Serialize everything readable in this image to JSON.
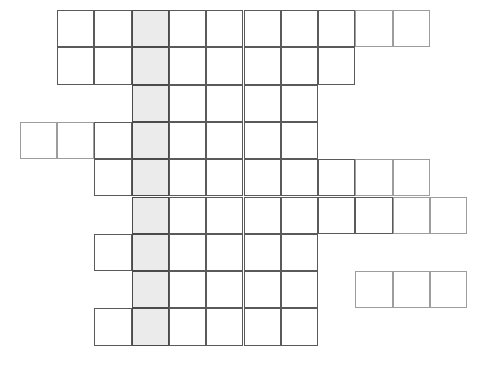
{
  "puzzle": {
    "kind": "crossword-grid",
    "title": "Crossword Puzzle Grid",
    "description": "Blank interlocking crossword grid of nine horizontal word rows with one vertically shaded highlight column.",
    "canvas": {
      "width": 487,
      "height": 373,
      "background": "#ffffff"
    },
    "geometry": {
      "cell_size": 37.3,
      "origin_x": 57,
      "origin_y": 10,
      "rows": 9,
      "column_index_min": -1,
      "column_index_max": 10
    },
    "colors": {
      "cell_fill": "#ffffff",
      "cell_stroke": "#5a5a5a",
      "cell_stroke_soft": "#9d9d9d",
      "shaded_fill": "#ebebeb",
      "shaded_stroke": "#4a4a4a"
    },
    "highlight": {
      "name": "key-answer-column",
      "column_index": 2,
      "from_row": 1,
      "to_row": 9,
      "cell_count": 9,
      "fill": "#ebebeb"
    },
    "totals": {
      "row_count": 9,
      "cell_count": 64,
      "shaded_cell_count": 9
    },
    "rows": [
      {
        "number": 1,
        "label": "row-1",
        "segments": [
          {
            "start": 0,
            "end": 9
          }
        ],
        "length": 10,
        "letters": [
          "",
          "",
          "",
          "",
          "",
          "",
          "",
          "",
          "",
          ""
        ]
      },
      {
        "number": 2,
        "label": "row-2",
        "segments": [
          {
            "start": 0,
            "end": 7
          }
        ],
        "length": 8,
        "letters": [
          "",
          "",
          "",
          "",
          "",
          "",
          "",
          ""
        ]
      },
      {
        "number": 3,
        "label": "row-3",
        "segments": [
          {
            "start": 2,
            "end": 6
          }
        ],
        "length": 5,
        "letters": [
          "",
          "",
          "",
          "",
          ""
        ]
      },
      {
        "number": 4,
        "label": "row-4",
        "segments": [
          {
            "start": -1,
            "end": 6
          }
        ],
        "length": 8,
        "letters": [
          "",
          "",
          "",
          "",
          "",
          "",
          "",
          ""
        ]
      },
      {
        "number": 5,
        "label": "row-5",
        "segments": [
          {
            "start": 1,
            "end": 9
          }
        ],
        "length": 9,
        "letters": [
          "",
          "",
          "",
          "",
          "",
          "",
          "",
          "",
          ""
        ]
      },
      {
        "number": 6,
        "label": "row-6",
        "segments": [
          {
            "start": 2,
            "end": 10
          }
        ],
        "length": 9,
        "letters": [
          "",
          "",
          "",
          "",
          "",
          "",
          "",
          "",
          ""
        ]
      },
      {
        "number": 7,
        "label": "row-7",
        "segments": [
          {
            "start": 1,
            "end": 6
          }
        ],
        "length": 6,
        "letters": [
          "",
          "",
          "",
          "",
          "",
          ""
        ]
      },
      {
        "number": 8,
        "label": "row-8",
        "segments": [
          {
            "start": 2,
            "end": 6
          },
          {
            "start": 8,
            "end": 10
          }
        ],
        "length": 8,
        "letters": [
          "",
          "",
          "",
          "",
          "",
          "",
          "",
          ""
        ]
      },
      {
        "number": 9,
        "label": "row-9",
        "segments": [
          {
            "start": 1,
            "end": 6
          }
        ],
        "length": 6,
        "letters": [
          "",
          "",
          "",
          "",
          "",
          ""
        ]
      }
    ],
    "soft_border_cells": [
      {
        "row": 1,
        "col": 8
      },
      {
        "row": 1,
        "col": 9
      },
      {
        "row": 4,
        "col": -1
      },
      {
        "row": 4,
        "col": 0
      },
      {
        "row": 5,
        "col": 8
      },
      {
        "row": 5,
        "col": 9
      },
      {
        "row": 6,
        "col": 9
      },
      {
        "row": 6,
        "col": 10
      },
      {
        "row": 8,
        "col": 8
      },
      {
        "row": 8,
        "col": 9
      },
      {
        "row": 8,
        "col": 10
      }
    ]
  }
}
